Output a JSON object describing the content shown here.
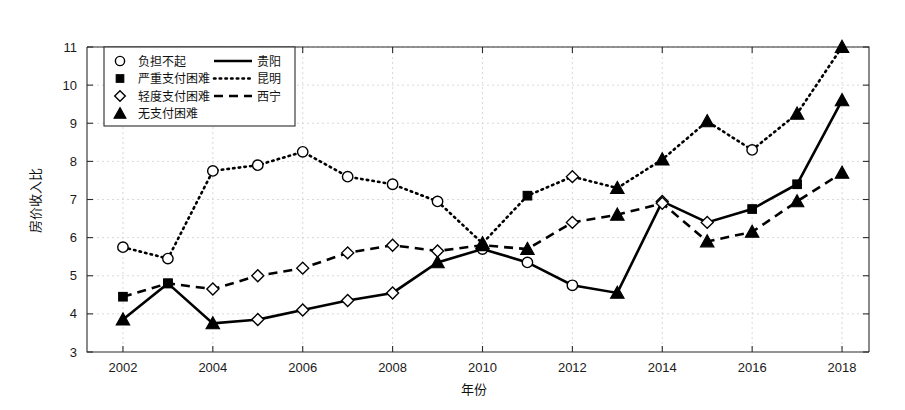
{
  "chart_data": {
    "type": "line",
    "title": "",
    "xlabel": "年份",
    "ylabel": "房价收入比",
    "xlim": [
      2001.2,
      2018.6
    ],
    "ylim": [
      3,
      11
    ],
    "ytick_labels": [
      "3",
      "4",
      "5",
      "6",
      "7",
      "8",
      "9",
      "10",
      "11"
    ],
    "yticks": [
      3,
      4,
      5,
      6,
      7,
      8,
      9,
      10,
      11
    ],
    "xtick_labels": [
      "2002",
      "2004",
      "2006",
      "2008",
      "2010",
      "2012",
      "2014",
      "2016",
      "2018"
    ],
    "xticks": [
      2002,
      2004,
      2006,
      2008,
      2010,
      2012,
      2014,
      2016,
      2018
    ],
    "grid": true,
    "legend_position": "upper-left",
    "x": [
      2002,
      2003,
      2004,
      2005,
      2006,
      2007,
      2008,
      2009,
      2010,
      2011,
      2012,
      2013,
      2014,
      2015,
      2016,
      2017,
      2018
    ],
    "series": [
      {
        "name": "贵阳",
        "line_style": "solid",
        "values": [
          3.85,
          4.8,
          3.75,
          3.85,
          4.1,
          4.35,
          4.55,
          5.35,
          5.7,
          5.35,
          4.75,
          4.55,
          6.95,
          6.4,
          6.75,
          7.4,
          9.6
        ],
        "markers": [
          "triangle",
          "square",
          "triangle",
          "diamond",
          "diamond",
          "diamond",
          "diamond",
          "triangle",
          "circle",
          "circle",
          "circle",
          "triangle",
          "diamond",
          "diamond",
          "square",
          "square",
          "triangle"
        ]
      },
      {
        "name": "昆明",
        "line_style": "dotted",
        "values": [
          5.75,
          5.45,
          7.75,
          7.9,
          8.25,
          7.6,
          7.4,
          6.95,
          5.85,
          7.1,
          7.6,
          7.3,
          8.05,
          9.05,
          8.3,
          9.25,
          11.0
        ],
        "markers": [
          "circle",
          "circle",
          "circle",
          "circle",
          "circle",
          "circle",
          "circle",
          "circle",
          "triangle",
          "square",
          "diamond",
          "triangle",
          "triangle",
          "triangle",
          "circle",
          "triangle",
          "triangle"
        ]
      },
      {
        "name": "西宁",
        "line_style": "dashed",
        "values": [
          4.45,
          4.8,
          4.65,
          5.0,
          5.2,
          5.6,
          5.8,
          5.65,
          5.8,
          5.7,
          6.4,
          6.6,
          6.9,
          5.9,
          6.15,
          6.95,
          7.7
        ],
        "markers": [
          "square",
          "square",
          "diamond",
          "diamond",
          "diamond",
          "diamond",
          "diamond",
          "diamond",
          "triangle",
          "triangle",
          "diamond",
          "triangle",
          "diamond",
          "triangle",
          "triangle",
          "triangle",
          "triangle"
        ]
      }
    ],
    "marker_legend": [
      {
        "marker": "circle",
        "label": "负担不起"
      },
      {
        "marker": "square",
        "label": "严重支付困难"
      },
      {
        "marker": "diamond",
        "label": "轻度支付困难"
      },
      {
        "marker": "triangle",
        "label": "无支付困难"
      }
    ],
    "line_legend": [
      {
        "line_style": "solid",
        "label": "贵阳"
      },
      {
        "line_style": "dotted",
        "label": "昆明"
      },
      {
        "line_style": "dashed",
        "label": "西宁"
      }
    ],
    "colors": {
      "ink": "#000000",
      "grid": "#c9c9c9",
      "background": "#ffffff"
    }
  }
}
